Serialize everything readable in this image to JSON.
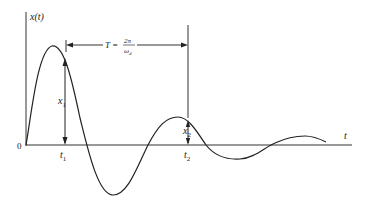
{
  "figure": {
    "type": "damped-oscillation-response",
    "colors": {
      "ink": "#222222",
      "background": "#ffffff"
    },
    "axes": {
      "y_label": "x(t)",
      "x_label": "t",
      "origin_label": "0"
    },
    "annotations": {
      "period_label_prefix": "T =",
      "period_numerator": "2π",
      "period_denominator_main": "ω",
      "period_denominator_sub": "d",
      "amp1_main": "x",
      "amp1_sub": "1",
      "amp2_main": "x",
      "amp2_sub": "2",
      "t1_main": "t",
      "t1_sub": "1",
      "t2_main": "t",
      "t2_sub": "2"
    }
  }
}
